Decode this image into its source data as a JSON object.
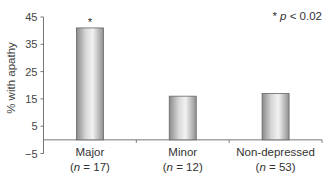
{
  "chart_data": {
    "type": "bar",
    "title": "",
    "xlabel": "",
    "ylabel": "% with apathy",
    "ylim": [
      -5,
      45
    ],
    "yticks": [
      -5,
      5,
      15,
      25,
      35,
      45
    ],
    "grid": false,
    "legend": null,
    "categories": [
      "Major",
      "Minor",
      "Non-depressed"
    ],
    "category_sublabels": [
      "(n = 17)",
      "(n = 12)",
      "(n = 53)"
    ],
    "sample_sizes": [
      17,
      12,
      53
    ],
    "values": [
      41,
      16,
      17
    ],
    "significance_markers": [
      "*",
      "",
      ""
    ],
    "annotation": "* p < 0.02",
    "bar_color": "#b8b8b8"
  }
}
